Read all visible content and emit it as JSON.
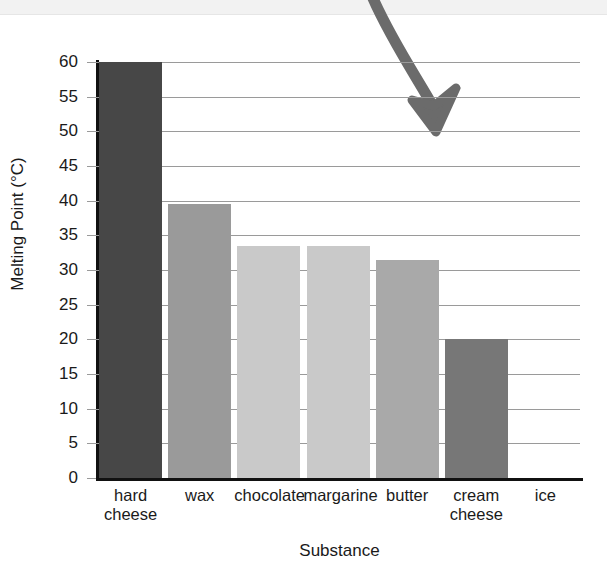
{
  "chart_data": {
    "type": "bar",
    "title": "",
    "xlabel": "Substance",
    "ylabel": "Melting Point (°C)",
    "categories": [
      "hard cheese",
      "wax",
      "chocolate",
      "margarine",
      "butter",
      "cream cheese",
      "ice"
    ],
    "category_lines": [
      [
        "hard",
        "cheese"
      ],
      [
        "wax"
      ],
      [
        "chocolate"
      ],
      [
        "margarine"
      ],
      [
        "butter"
      ],
      [
        "cream",
        "cheese"
      ],
      [
        "ice"
      ]
    ],
    "values": [
      60,
      39.5,
      33.4,
      33.4,
      31.5,
      20,
      0
    ],
    "bar_colors": [
      "#474747",
      "#9a9a9a",
      "#c9c9c9",
      "#c9c9c9",
      "#a9a9a9",
      "#777777",
      "#ffffff"
    ],
    "ylim": [
      0,
      60
    ],
    "ytick_labels": [
      "60",
      "55",
      "50",
      "45",
      "40",
      "35",
      "30",
      "25",
      "20",
      "15",
      "10",
      "5",
      "0"
    ],
    "ytick_values": [
      60,
      55,
      50,
      45,
      40,
      35,
      30,
      25,
      20,
      15,
      10,
      5,
      0
    ],
    "grid": true,
    "legend": "none",
    "annotations": [
      {
        "name": "down-arrow",
        "kind": "curved-arrow",
        "color": "#6b6b6b",
        "points_to": "plot-area"
      }
    ]
  },
  "page": {
    "top_clipped_text": "",
    "axis_color": "#111111",
    "gridline_color": "#9a9a9a",
    "background": "#ffffff"
  }
}
